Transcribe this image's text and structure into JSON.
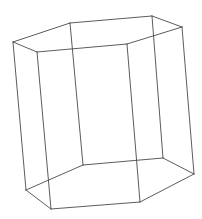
{
  "figure": {
    "stroke_color": "#4a4a4a",
    "background": "#ffffff",
    "vertices": {
      "top": [
        [
          13,
          42
        ],
        [
          70,
          23
        ],
        [
          152,
          16
        ],
        [
          182,
          27
        ],
        [
          127,
          44
        ],
        [
          37,
          52
        ]
      ],
      "bottom": [
        [
          26,
          190
        ],
        [
          83,
          165
        ],
        [
          163,
          158
        ],
        [
          194,
          174
        ],
        [
          140,
          202
        ],
        [
          51,
          209
        ]
      ]
    }
  }
}
